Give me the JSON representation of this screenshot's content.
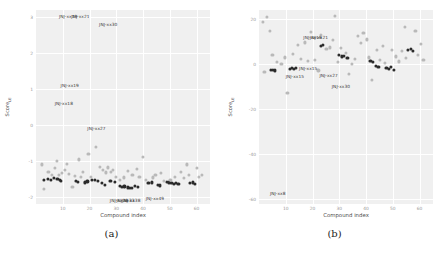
{
  "figure": {
    "background": "#ffffff",
    "panel_background": "#f0f0f0",
    "grid_color": "#ffffff",
    "dark_point_color": "#2b2b2b",
    "light_point_color": "#b9b9b9"
  },
  "panels": [
    {
      "caption": "(a)",
      "xlabel": "Compound index",
      "ylabel_main": "Score",
      "ylabel_sub": "LE"
    },
    {
      "caption": "(b)",
      "xlabel": "Compound index",
      "ylabel_main": "Score",
      "ylabel_sub": "LE"
    }
  ],
  "chart_data": [
    {
      "type": "scatter",
      "title": "(a)",
      "xlabel": "Compound index",
      "ylabel": "Score_LE",
      "xlim": [
        0,
        65
      ],
      "ylim": [
        -2.2,
        3.2
      ],
      "xticks": [
        10,
        20,
        30,
        40,
        50,
        60
      ],
      "xtick_labels": [
        "10",
        "20",
        "30",
        "40",
        "50",
        "60"
      ],
      "yticks": [
        -2,
        -1,
        0,
        1,
        2,
        3
      ],
      "ytick_labels": [
        "-2",
        "-1",
        "0",
        "1",
        "2",
        "3"
      ],
      "grid": true,
      "legend_position": "none",
      "series": [
        {
          "name": "dark",
          "marker": "filled-circle",
          "color": "#2b2b2b",
          "points": [
            [
              3.0,
              -1.52
            ],
            [
              4.4,
              -1.5
            ],
            [
              5.6,
              -1.53
            ],
            [
              6.6,
              -1.48
            ],
            [
              8.0,
              -1.5
            ],
            [
              8.8,
              -1.52
            ],
            [
              9.4,
              -1.55
            ],
            [
              14.8,
              -1.56
            ],
            [
              15.6,
              -1.58
            ],
            [
              18.2,
              -1.6
            ],
            [
              19.2,
              -1.57
            ],
            [
              21.0,
              -1.52
            ],
            [
              22.0,
              -1.54
            ],
            [
              23.2,
              -1.55
            ],
            [
              24.6,
              -1.62
            ],
            [
              25.6,
              -1.66
            ],
            [
              27.8,
              -1.56
            ],
            [
              29.4,
              -1.58
            ],
            [
              31.4,
              -1.7
            ],
            [
              32.2,
              -1.72
            ],
            [
              33.0,
              -1.71
            ],
            [
              34.2,
              -1.74
            ],
            [
              35.0,
              -1.76
            ],
            [
              35.8,
              -1.75
            ],
            [
              37.0,
              -1.7
            ],
            [
              38.0,
              -1.72
            ],
            [
              42.0,
              -1.62
            ],
            [
              43.2,
              -1.6
            ],
            [
              45.4,
              -1.66
            ],
            [
              46.4,
              -1.68
            ],
            [
              48.8,
              -1.58
            ],
            [
              49.8,
              -1.6
            ],
            [
              50.6,
              -1.62
            ],
            [
              51.6,
              -1.63
            ],
            [
              52.4,
              -1.61
            ],
            [
              53.2,
              -1.64
            ],
            [
              57.6,
              -1.62
            ],
            [
              58.6,
              -1.6
            ],
            [
              59.4,
              -1.63
            ]
          ]
        },
        {
          "name": "light",
          "marker": "open-circle",
          "color": "#b9b9b9",
          "points": [
            [
              2.2,
              -1.1
            ],
            [
              3.0,
              -1.78
            ],
            [
              4.6,
              -1.3
            ],
            [
              6.0,
              -1.38
            ],
            [
              7.2,
              -1.2
            ],
            [
              7.8,
              -1.0
            ],
            [
              8.6,
              -1.4
            ],
            [
              9.6,
              -1.34
            ],
            [
              10.8,
              -1.24
            ],
            [
              11.4,
              -1.08
            ],
            [
              12.4,
              -1.36
            ],
            [
              13.6,
              -1.72
            ],
            [
              14.6,
              -1.42
            ],
            [
              16.0,
              -0.96
            ],
            [
              16.8,
              -1.44
            ],
            [
              17.6,
              -1.3
            ],
            [
              19.6,
              -0.8
            ],
            [
              20.6,
              -1.44
            ],
            [
              22.4,
              -0.62
            ],
            [
              23.8,
              -1.16
            ],
            [
              25.0,
              -1.24
            ],
            [
              26.0,
              -1.32
            ],
            [
              26.8,
              -1.18
            ],
            [
              28.0,
              -1.3
            ],
            [
              28.8,
              -1.26
            ],
            [
              30.0,
              -1.44
            ],
            [
              31.2,
              -1.52
            ],
            [
              32.8,
              -1.46
            ],
            [
              34.4,
              -1.28
            ],
            [
              36.0,
              -1.38
            ],
            [
              37.6,
              -1.22
            ],
            [
              38.6,
              -1.44
            ],
            [
              40.0,
              -0.9
            ],
            [
              41.0,
              -1.52
            ],
            [
              43.6,
              -1.46
            ],
            [
              44.6,
              -1.4
            ],
            [
              46.8,
              -1.34
            ],
            [
              47.8,
              -1.56
            ],
            [
              50.2,
              -1.52
            ],
            [
              52.0,
              -1.44
            ],
            [
              54.2,
              -1.3
            ],
            [
              55.2,
              -1.48
            ],
            [
              56.4,
              -1.1
            ],
            [
              57.2,
              -1.4
            ],
            [
              60.0,
              -1.2
            ],
            [
              61.0,
              -1.44
            ],
            [
              62.0,
              -1.38
            ]
          ]
        }
      ],
      "annotations": [
        {
          "text": "JNJ-xx19",
          "x": 12.0,
          "y": 3.02
        },
        {
          "text": "JNJ-xx21",
          "x": 16.6,
          "y": 3.02
        },
        {
          "text": "JNJ-xx30",
          "x": 27.0,
          "y": 2.82
        },
        {
          "text": "JNJ-xx19",
          "x": 12.6,
          "y": 1.1
        },
        {
          "text": "JNJ-xx18",
          "x": 10.4,
          "y": 0.62
        },
        {
          "text": "JNJ-xx27",
          "x": 22.6,
          "y": -0.08
        },
        {
          "text": "JNJ-xx28",
          "x": 31.0,
          "y": -2.08
        },
        {
          "text": "JNJ-xx33",
          "x": 33.4,
          "y": -2.08
        },
        {
          "text": "JNJ-xx38",
          "x": 35.6,
          "y": -2.08
        },
        {
          "text": "JNJ-xx49",
          "x": 44.4,
          "y": -2.04
        }
      ]
    },
    {
      "type": "scatter",
      "title": "(b)",
      "xlabel": "Compound index",
      "ylabel": "Score_LE",
      "xlim": [
        0,
        65
      ],
      "ylim": [
        -62,
        24
      ],
      "xticks": [
        10,
        20,
        30,
        40,
        50,
        60
      ],
      "xtick_labels": [
        "10",
        "20",
        "30",
        "40",
        "50",
        "60"
      ],
      "yticks": [
        -60,
        -40,
        -20,
        0,
        20
      ],
      "ytick_labels": [
        "-60",
        "-40",
        "-20",
        "0",
        "20"
      ],
      "grid": true,
      "legend_position": "none",
      "series": [
        {
          "name": "dark",
          "marker": "filled-circle",
          "color": "#2b2b2b",
          "points": [
            [
              4.4,
              -2.6
            ],
            [
              5.2,
              -2.4
            ],
            [
              5.8,
              -2.8
            ],
            [
              11.4,
              -2.0
            ],
            [
              12.2,
              -1.8
            ],
            [
              13.0,
              -2.2
            ],
            [
              13.8,
              -1.6
            ],
            [
              23.2,
              8.0
            ],
            [
              24.0,
              8.4
            ],
            [
              30.0,
              4.0
            ],
            [
              31.0,
              3.4
            ],
            [
              31.8,
              3.8
            ],
            [
              33.0,
              2.6
            ],
            [
              41.6,
              1.4
            ],
            [
              42.6,
              1.0
            ],
            [
              43.8,
              -0.8
            ],
            [
              44.6,
              -1.2
            ],
            [
              47.6,
              -1.6
            ],
            [
              48.4,
              -2.0
            ],
            [
              49.2,
              -1.4
            ],
            [
              50.4,
              -2.4
            ],
            [
              55.6,
              6.2
            ],
            [
              56.6,
              6.6
            ],
            [
              57.4,
              6.0
            ]
          ]
        },
        {
          "name": "light",
          "marker": "open-circle",
          "color": "#b9b9b9",
          "points": [
            [
              1.6,
              18.8
            ],
            [
              3.0,
              21.0
            ],
            [
              4.0,
              14.6
            ],
            [
              2.0,
              -3.6
            ],
            [
              5.0,
              4.2
            ],
            [
              6.6,
              1.0
            ],
            [
              8.4,
              0.2
            ],
            [
              9.8,
              3.0
            ],
            [
              10.6,
              -12.8
            ],
            [
              12.8,
              4.6
            ],
            [
              14.6,
              8.6
            ],
            [
              15.8,
              2.4
            ],
            [
              17.0,
              9.6
            ],
            [
              18.2,
              1.6
            ],
            [
              19.4,
              14.2
            ],
            [
              20.8,
              2.0
            ],
            [
              22.2,
              -2.8
            ],
            [
              23.0,
              12.8
            ],
            [
              25.2,
              6.6
            ],
            [
              26.4,
              7.4
            ],
            [
              27.6,
              10.6
            ],
            [
              28.4,
              21.4
            ],
            [
              29.4,
              1.0
            ],
            [
              30.6,
              7.2
            ],
            [
              32.4,
              5.0
            ],
            [
              33.6,
              -4.2
            ],
            [
              34.6,
              0.2
            ],
            [
              35.8,
              2.2
            ],
            [
              36.8,
              12.4
            ],
            [
              38.0,
              9.4
            ],
            [
              39.0,
              14.0
            ],
            [
              40.2,
              11.0
            ],
            [
              41.0,
              3.0
            ],
            [
              42.2,
              -7.0
            ],
            [
              44.0,
              6.4
            ],
            [
              45.2,
              2.0
            ],
            [
              46.2,
              8.0
            ],
            [
              47.0,
              0.6
            ],
            [
              49.6,
              6.2
            ],
            [
              51.0,
              3.4
            ],
            [
              52.2,
              1.2
            ],
            [
              53.4,
              6.0
            ],
            [
              54.4,
              16.6
            ],
            [
              55.0,
              2.6
            ],
            [
              58.4,
              14.8
            ],
            [
              59.4,
              4.0
            ],
            [
              60.4,
              9.0
            ],
            [
              61.4,
              1.8
            ]
          ]
        }
      ],
      "annotations": [
        {
          "text": "JNJ-xx19",
          "x": 20.0,
          "y": 12.2
        },
        {
          "text": "JNJ-xx21",
          "x": 22.4,
          "y": 12.2
        },
        {
          "text": "JNJ-xx15",
          "x": 18.4,
          "y": -1.6
        },
        {
          "text": "JNJ-xx15",
          "x": 13.4,
          "y": -5.2
        },
        {
          "text": "JNJ-xx27",
          "x": 26.0,
          "y": -5.0
        },
        {
          "text": "JNJ-xx30",
          "x": 30.6,
          "y": -9.6
        },
        {
          "text": "JNJ-xx8",
          "x": 7.0,
          "y": -57.0
        }
      ]
    }
  ]
}
